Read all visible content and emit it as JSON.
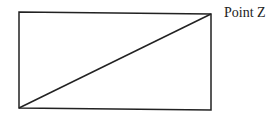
{
  "diagram": {
    "type": "rectangle-with-diagonal",
    "stroke_color": "#222222",
    "rectangle": {
      "x1": 19,
      "y1": 12,
      "x2": 211,
      "y2": 110
    },
    "diagonal": {
      "from": "bottom-left",
      "to": "top-right"
    },
    "labels": [
      {
        "text": "Point Z",
        "anchor": "top-right corner"
      }
    ]
  }
}
